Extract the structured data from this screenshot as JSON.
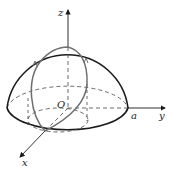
{
  "diagram": {
    "type": "3d-hemisphere-with-viviani-curve",
    "labels": {
      "z_axis": "z",
      "y_axis": "y",
      "x_axis": "x",
      "origin": "O",
      "radius": "a"
    },
    "colors": {
      "outline": "#1a1a1a",
      "curve": "#6e6e6e",
      "dashed": "#444444",
      "background": "#ffffff"
    }
  }
}
